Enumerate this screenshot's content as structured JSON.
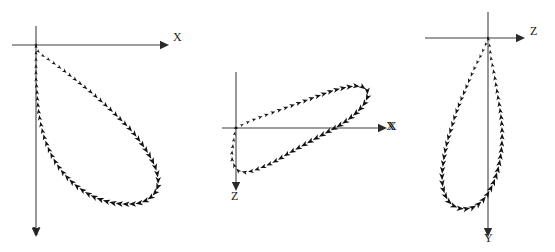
{
  "figure": {
    "background_color": "#ffffff",
    "axis_color": "#7d7d7d",
    "marker_color": "#121212",
    "width": 555,
    "height": 252
  },
  "panels": [
    {
      "id": "panel-xy",
      "name": "projection-xy",
      "origin": {
        "x": 36,
        "y": 45
      },
      "horizontal_axis": {
        "label": "X",
        "label_pos": {
          "x": 173,
          "y": 31
        },
        "from": {
          "x": 12,
          "y": 45
        },
        "to": {
          "x": 160,
          "y": 45
        },
        "direction": "right"
      },
      "vertical_axis": {
        "label": "Y",
        "label_pos": {
          "x": 32,
          "y": 225
        },
        "from": {
          "x": 36,
          "y": 26
        },
        "to": {
          "x": 36,
          "y": 228
        },
        "direction": "down"
      }
    },
    {
      "id": "panel-xz",
      "name": "projection-xz",
      "origin": {
        "x": 236,
        "y": 128
      },
      "horizontal_axis": {
        "label": "X",
        "label_pos": {
          "x": 388,
          "y": 120
        },
        "from": {
          "x": 222,
          "y": 128
        },
        "to": {
          "x": 378,
          "y": 128
        },
        "direction": "right"
      },
      "vertical_axis": {
        "label": "Z",
        "label_pos": {
          "x": 231,
          "y": 190
        },
        "from": {
          "x": 236,
          "y": 72
        },
        "to": {
          "x": 236,
          "y": 182
        },
        "direction": "down"
      }
    },
    {
      "id": "panel-zy",
      "name": "projection-zy",
      "origin": {
        "x": 488,
        "y": 38
      },
      "horizontal_axis": {
        "label": "Z",
        "label_pos": {
          "x": 530,
          "y": 25
        },
        "from": {
          "x": 425,
          "y": 38
        },
        "to": {
          "x": 516,
          "y": 38
        },
        "direction": "right"
      },
      "vertical_axis": {
        "label": "Y",
        "label_pos": {
          "x": 484,
          "y": 232
        },
        "from": {
          "x": 488,
          "y": 12
        },
        "to": {
          "x": 488,
          "y": 228
        },
        "direction": "down"
      },
      "extra_label": {
        "label": "X",
        "label_pos": {
          "x": 386,
          "y": 120
        }
      }
    }
  ],
  "chart_data": {
    "type": "scatter",
    "xlabel": "",
    "ylabel": "",
    "grid": false,
    "legend": "none",
    "note": "Three orthographic projections of one closed teardrop-shaped 3D trajectory loop, drawn with small filled arrowhead markers on arrow-terminated axes.",
    "series": [
      {
        "name": "projection-xy",
        "panel": "panel-xy",
        "axes": {
          "horizontal": "X",
          "vertical": "Y"
        },
        "closed": true,
        "marker": "filled-arrowhead",
        "points": [
          [
            0,
            0
          ],
          [
            2,
            6
          ],
          [
            6,
            10
          ],
          [
            12,
            14
          ],
          [
            19,
            19
          ],
          [
            27,
            25
          ],
          [
            36,
            32
          ],
          [
            46,
            40
          ],
          [
            56,
            48
          ],
          [
            66,
            57
          ],
          [
            76,
            66
          ],
          [
            86,
            76
          ],
          [
            95,
            85
          ],
          [
            103,
            95
          ],
          [
            110,
            105
          ],
          [
            116,
            115
          ],
          [
            120,
            124
          ],
          [
            122,
            133
          ],
          [
            122,
            141
          ],
          [
            119,
            148
          ],
          [
            114,
            153
          ],
          [
            107,
            157
          ],
          [
            98,
            159
          ],
          [
            88,
            159
          ],
          [
            77,
            158
          ],
          [
            66,
            155
          ],
          [
            56,
            151
          ],
          [
            46,
            145
          ],
          [
            37,
            138
          ],
          [
            29,
            130
          ],
          [
            22,
            121
          ],
          [
            16,
            111
          ],
          [
            11,
            100
          ],
          [
            7,
            88
          ],
          [
            4,
            75
          ],
          [
            2,
            61
          ],
          [
            1,
            47
          ],
          [
            0,
            33
          ],
          [
            0,
            20
          ],
          [
            0,
            9
          ],
          [
            0,
            0
          ]
        ]
      },
      {
        "name": "projection-xz",
        "panel": "panel-xz",
        "axes": {
          "horizontal": "X",
          "vertical": "Z"
        },
        "closed": true,
        "marker": "filled-arrowhead",
        "points": [
          [
            0,
            0
          ],
          [
            8,
            -4
          ],
          [
            17,
            -8
          ],
          [
            27,
            -12
          ],
          [
            38,
            -16
          ],
          [
            49,
            -20
          ],
          [
            60,
            -24
          ],
          [
            71,
            -28
          ],
          [
            82,
            -32
          ],
          [
            93,
            -36
          ],
          [
            103,
            -39
          ],
          [
            112,
            -41
          ],
          [
            120,
            -42
          ],
          [
            127,
            -41
          ],
          [
            131,
            -38
          ],
          [
            132,
            -33
          ],
          [
            130,
            -27
          ],
          [
            125,
            -20
          ],
          [
            118,
            -13
          ],
          [
            109,
            -6
          ],
          [
            99,
            0
          ],
          [
            88,
            6
          ],
          [
            77,
            12
          ],
          [
            66,
            18
          ],
          [
            55,
            24
          ],
          [
            45,
            30
          ],
          [
            36,
            35
          ],
          [
            27,
            39
          ],
          [
            19,
            42
          ],
          [
            12,
            44
          ],
          [
            6,
            44
          ],
          [
            1,
            42
          ],
          [
            -2,
            37
          ],
          [
            -4,
            31
          ],
          [
            -4,
            24
          ],
          [
            -3,
            17
          ],
          [
            -2,
            10
          ],
          [
            -1,
            4
          ],
          [
            0,
            0
          ]
        ]
      },
      {
        "name": "projection-zy",
        "panel": "panel-zy",
        "axes": {
          "horizontal": "Z",
          "vertical": "Y"
        },
        "closed": true,
        "marker": "filled-arrowhead",
        "points": [
          [
            0,
            0
          ],
          [
            -3,
            8
          ],
          [
            -7,
            17
          ],
          [
            -12,
            27
          ],
          [
            -17,
            38
          ],
          [
            -22,
            50
          ],
          [
            -27,
            62
          ],
          [
            -32,
            75
          ],
          [
            -36,
            88
          ],
          [
            -40,
            101
          ],
          [
            -43,
            114
          ],
          [
            -45,
            127
          ],
          [
            -46,
            139
          ],
          [
            -45,
            150
          ],
          [
            -42,
            159
          ],
          [
            -37,
            166
          ],
          [
            -30,
            170
          ],
          [
            -22,
            171
          ],
          [
            -14,
            169
          ],
          [
            -7,
            164
          ],
          [
            -1,
            157
          ],
          [
            4,
            148
          ],
          [
            8,
            138
          ],
          [
            11,
            127
          ],
          [
            13,
            115
          ],
          [
            14,
            103
          ],
          [
            14,
            90
          ],
          [
            13,
            78
          ],
          [
            11,
            65
          ],
          [
            9,
            53
          ],
          [
            7,
            41
          ],
          [
            5,
            30
          ],
          [
            3,
            20
          ],
          [
            2,
            11
          ],
          [
            1,
            4
          ],
          [
            0,
            0
          ]
        ]
      }
    ]
  }
}
